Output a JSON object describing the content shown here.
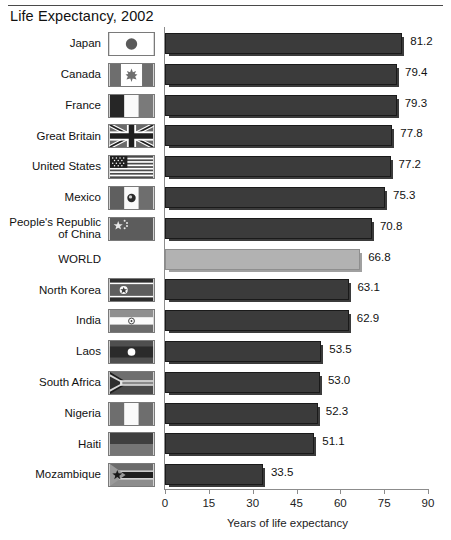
{
  "header": {
    "title": "Life Expectancy, 2002"
  },
  "chart_data": {
    "type": "bar",
    "orientation": "horizontal",
    "title": "Life Expectancy, 2002",
    "xlabel": "Years of life expectancy",
    "ylabel": "",
    "xlim": [
      0,
      90
    ],
    "xticks": [
      0,
      15,
      30,
      45,
      60,
      75,
      90
    ],
    "grid": false,
    "legend": "none",
    "categories": [
      "Japan",
      "Canada",
      "France",
      "Great Britain",
      "United States",
      "Mexico",
      "People's Republic of China",
      "WORLD",
      "North Korea",
      "India",
      "Laos",
      "South Africa",
      "Nigeria",
      "Haiti",
      "Mozambique"
    ],
    "values": [
      81.2,
      79.4,
      79.3,
      77.8,
      77.2,
      75.3,
      70.8,
      66.8,
      63.1,
      62.9,
      53.5,
      53.0,
      52.3,
      51.1,
      33.5
    ],
    "value_labels": [
      "81.2",
      "79.4",
      "79.3",
      "77.8",
      "77.2",
      "75.3",
      "70.8",
      "66.8",
      "63.1",
      "62.9",
      "53.5",
      "53.0",
      "52.3",
      "51.1",
      "33.5"
    ],
    "highlight_category": "WORLD",
    "colors": {
      "bar": "#3b3b3b",
      "bar_highlight": "#b2b2b2",
      "axis": "#8c8c8c",
      "text": "#111111",
      "background": "#ffffff"
    }
  },
  "rows": [
    {
      "label": "Japan",
      "label_lines": [
        "Japan"
      ],
      "value": 81.2,
      "value_label": "81.2",
      "flag": "flag-japan",
      "has_flag": true,
      "highlight": false
    },
    {
      "label": "Canada",
      "label_lines": [
        "Canada"
      ],
      "value": 79.4,
      "value_label": "79.4",
      "flag": "flag-canada",
      "has_flag": true,
      "highlight": false
    },
    {
      "label": "France",
      "label_lines": [
        "France"
      ],
      "value": 79.3,
      "value_label": "79.3",
      "flag": "flag-france",
      "has_flag": true,
      "highlight": false
    },
    {
      "label": "Great Britain",
      "label_lines": [
        "Great Britain"
      ],
      "value": 77.8,
      "value_label": "77.8",
      "flag": "flag-great-britain",
      "has_flag": true,
      "highlight": false
    },
    {
      "label": "United States",
      "label_lines": [
        "United States"
      ],
      "value": 77.2,
      "value_label": "77.2",
      "flag": "flag-united-states",
      "has_flag": true,
      "highlight": false
    },
    {
      "label": "Mexico",
      "label_lines": [
        "Mexico"
      ],
      "value": 75.3,
      "value_label": "75.3",
      "flag": "flag-mexico",
      "has_flag": true,
      "highlight": false
    },
    {
      "label": "People's Republic of China",
      "label_lines": [
        "People's Republic",
        "of China"
      ],
      "value": 70.8,
      "value_label": "70.8",
      "flag": "flag-china",
      "has_flag": true,
      "highlight": false
    },
    {
      "label": "WORLD",
      "label_lines": [
        "WORLD"
      ],
      "value": 66.8,
      "value_label": "66.8",
      "flag": "",
      "has_flag": false,
      "highlight": true
    },
    {
      "label": "North Korea",
      "label_lines": [
        "North Korea"
      ],
      "value": 63.1,
      "value_label": "63.1",
      "flag": "flag-north-korea",
      "has_flag": true,
      "highlight": false
    },
    {
      "label": "India",
      "label_lines": [
        "India"
      ],
      "value": 62.9,
      "value_label": "62.9",
      "flag": "flag-india",
      "has_flag": true,
      "highlight": false
    },
    {
      "label": "Laos",
      "label_lines": [
        "Laos"
      ],
      "value": 53.5,
      "value_label": "53.5",
      "flag": "flag-laos",
      "has_flag": true,
      "highlight": false
    },
    {
      "label": "South Africa",
      "label_lines": [
        "South Africa"
      ],
      "value": 53.0,
      "value_label": "53.0",
      "flag": "flag-south-africa",
      "has_flag": true,
      "highlight": false
    },
    {
      "label": "Nigeria",
      "label_lines": [
        "Nigeria"
      ],
      "value": 52.3,
      "value_label": "52.3",
      "flag": "flag-nigeria",
      "has_flag": true,
      "highlight": false
    },
    {
      "label": "Haiti",
      "label_lines": [
        "Haiti"
      ],
      "value": 51.1,
      "value_label": "51.1",
      "flag": "flag-haiti",
      "has_flag": true,
      "highlight": false
    },
    {
      "label": "Mozambique",
      "label_lines": [
        "Mozambique"
      ],
      "value": 33.5,
      "value_label": "33.5",
      "flag": "flag-mozambique",
      "has_flag": true,
      "highlight": false
    }
  ],
  "axis": {
    "ticks": [
      "0",
      "15",
      "30",
      "45",
      "60",
      "75",
      "90"
    ],
    "caption": "Years of life expectancy"
  }
}
